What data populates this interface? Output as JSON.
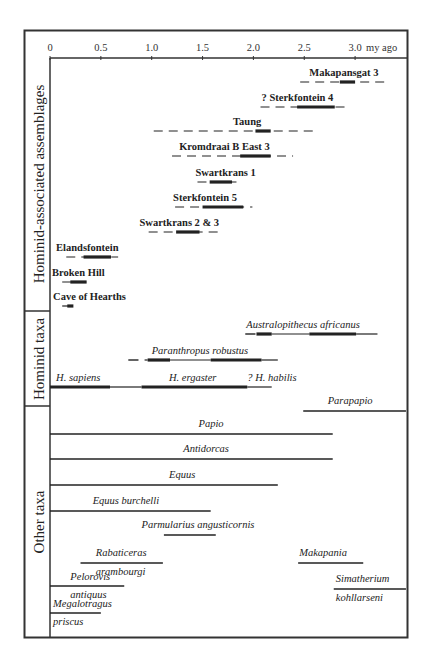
{
  "chart_data": {
    "type": "range-bar",
    "title": "",
    "xlabel": "my ago",
    "x_unit_label": "my ago",
    "xlim": [
      0,
      3.5
    ],
    "x_ticks": [
      0,
      0.5,
      1.0,
      1.5,
      2.0,
      2.5,
      3.0
    ],
    "x_tick_labels": [
      "0",
      "0.5",
      "1.0",
      "1.5",
      "2.0",
      "2.5",
      "3.0"
    ],
    "grid": false,
    "groups": [
      {
        "name": "Hominid-associated assemblages",
        "items": [
          {
            "label": "Makapansgat 3",
            "style": "bold",
            "y": 82,
            "label_y": 76,
            "label_x": 2.55,
            "possible": [
              2.46,
              3.31
            ],
            "probable": [
              2.85,
              3.0
            ]
          },
          {
            "label": "? Sterkfontein 4",
            "style": "bold",
            "y": 107,
            "label_y": 101,
            "label_x": 2.08,
            "possible": [
              2.07,
              2.93
            ],
            "probable": [
              2.43,
              2.8
            ]
          },
          {
            "label": "Taung",
            "style": "bold",
            "y": 131,
            "label_y": 125,
            "label_x": 1.8,
            "possible": [
              1.02,
              2.64
            ],
            "probable": [
              2.02,
              2.17
            ]
          },
          {
            "label": "Kromdraai B East 3",
            "style": "bold",
            "y": 156,
            "label_y": 150,
            "label_x": 1.27,
            "possible": [
              1.2,
              2.39
            ],
            "probable": [
              1.87,
              2.17
            ]
          },
          {
            "label": "Swartkrans 1",
            "style": "bold",
            "y": 182,
            "label_y": 176,
            "label_x": 1.43,
            "possible": [
              1.45,
              1.87
            ],
            "probable": [
              1.57,
              1.79
            ]
          },
          {
            "label": "Sterkfontein 5",
            "style": "bold",
            "y": 207,
            "label_y": 201,
            "label_x": 1.21,
            "possible": [
              1.23,
              1.99
            ],
            "probable": [
              1.5,
              1.9
            ]
          },
          {
            "label": "Swartkrans 2 & 3",
            "style": "bold",
            "y": 232,
            "label_y": 226,
            "label_x": 0.88,
            "possible": [
              0.97,
              1.69
            ],
            "probable": [
              1.24,
              1.47
            ]
          },
          {
            "label": "Elandsfontein",
            "style": "bold",
            "y": 257,
            "label_y": 251,
            "label_x": 0.06,
            "possible": [
              0.16,
              0.67
            ],
            "probable": [
              0.33,
              0.6
            ]
          },
          {
            "label": "Broken Hill",
            "style": "bold",
            "y": 282,
            "label_y": 276,
            "label_x": 0.02,
            "possible": [
              0.12,
              0.36
            ],
            "probable": [
              0.2,
              0.36
            ]
          },
          {
            "label": "Cave of Hearths",
            "style": "bold",
            "y": 306,
            "label_y": 300,
            "label_x": 0.03,
            "possible": [
              0.12,
              0.26
            ],
            "probable": [
              0.17,
              0.23
            ]
          }
        ]
      },
      {
        "name": "Hominid taxa",
        "items": [
          {
            "label": "Australopithecus africanus",
            "style": "italic",
            "y": 334,
            "label_y": 328,
            "label_x": 1.93,
            "segments": [
              [
                1.92,
                2.02,
                "dash"
              ],
              [
                2.03,
                2.18,
                "thick"
              ],
              [
                2.18,
                2.55,
                "thin"
              ],
              [
                2.55,
                3.01,
                "thick"
              ],
              [
                3.01,
                3.22,
                "thin"
              ]
            ]
          },
          {
            "label": "Paranthropus robustus",
            "style": "italic",
            "y": 360,
            "label_y": 354,
            "label_x": 1.0,
            "segments": [
              [
                0.77,
                0.87,
                "dash"
              ],
              [
                0.93,
                0.96,
                "thin"
              ],
              [
                0.96,
                1.18,
                "thick"
              ],
              [
                1.18,
                1.58,
                "thin"
              ],
              [
                1.58,
                2.08,
                "thick"
              ],
              [
                2.08,
                2.24,
                "thin"
              ]
            ]
          },
          {
            "label": "H. sapiens",
            "style": "italic",
            "y": 387,
            "label_y": 381,
            "label_x": 0.06,
            "segments": [
              [
                0,
                0.59,
                "thick"
              ],
              [
                0.59,
                0.9,
                "thin"
              ]
            ]
          },
          {
            "label": "H. ergaster",
            "style": "italic",
            "y": 387,
            "label_y": 381,
            "label_x": 1.17,
            "segments": [
              [
                0.9,
                1.94,
                "thick"
              ]
            ]
          },
          {
            "label": "? H. habilis",
            "style": "italic",
            "y": 387,
            "label_y": 381,
            "label_x": 1.94,
            "segments": [
              [
                1.94,
                2.18,
                "thin"
              ]
            ]
          }
        ]
      },
      {
        "name": "Other taxa",
        "items": [
          {
            "label": "Parapapio",
            "style": "italic",
            "y": 411,
            "label_y": 404,
            "label_x": 2.73,
            "range": [
              2.49,
              3.5
            ]
          },
          {
            "label": "Papio",
            "style": "italic",
            "y": 434,
            "label_y": 427,
            "label_x": 1.46,
            "range": [
              0,
              2.78
            ]
          },
          {
            "label": "Antidorcas",
            "style": "italic",
            "y": 459,
            "label_y": 452,
            "label_x": 1.31,
            "range": [
              0,
              2.78
            ]
          },
          {
            "label": "Equus",
            "style": "italic",
            "y": 485,
            "label_y": 478,
            "label_x": 1.17,
            "range": [
              0,
              2.24
            ]
          },
          {
            "label": "Equus burchelli",
            "style": "italic",
            "y": 511,
            "label_y": 504,
            "label_x": 0.42,
            "range": [
              0,
              1.58
            ]
          },
          {
            "label": "Parmularius angusticornis",
            "style": "italic",
            "y": 535,
            "label_y": 528,
            "label_x": 0.9,
            "range": [
              1.12,
              1.63
            ]
          },
          {
            "label": "Rabaticeras",
            "label2": "arambourgi",
            "style": "italic",
            "y": 563,
            "label_y": 556,
            "label2_y": 575,
            "label_x": 0.45,
            "range": [
              0.3,
              1.11
            ]
          },
          {
            "label": "Makapania",
            "style": "italic",
            "y": 563,
            "label_y": 556,
            "label_x": 2.45,
            "range": [
              2.44,
              3.08
            ]
          },
          {
            "label": "Pelorovis",
            "label2": "antiquus",
            "style": "italic",
            "y": 586,
            "label_y": 580,
            "label2_y": 598,
            "label_x": 0.2,
            "range": [
              0,
              0.73
            ]
          },
          {
            "label": "Simatherium",
            "label2": "kohllarseni",
            "style": "italic",
            "y": 589,
            "label_y": 582,
            "label2_y": 601,
            "label_x": 2.81,
            "range": [
              2.79,
              3.5
            ]
          },
          {
            "label": "Megalotragus",
            "label2": "priscus",
            "style": "italic",
            "y": 613,
            "label_y": 607,
            "label2_y": 625,
            "label_x": 0.03,
            "range": [
              0,
              0.5
            ]
          }
        ]
      }
    ],
    "legend": {
      "thick_solid": "probable / well-constrained age",
      "thin_solid": "range",
      "dashed": "possible age range"
    }
  },
  "axis": {
    "unit_label": "my ago",
    "tick_labels": [
      "0",
      "0.5",
      "1.0",
      "1.5",
      "2.0",
      "2.5",
      "3.0"
    ]
  },
  "sections": {
    "assemblages": "Hominid-associated assemblages",
    "hominid_taxa": "Hominid taxa",
    "other_taxa": "Other taxa"
  }
}
